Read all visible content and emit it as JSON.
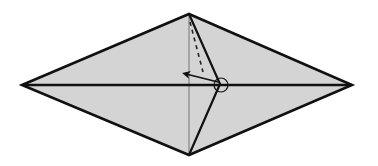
{
  "diagram": {
    "type": "origami-fold-step",
    "colors": {
      "paper_fill": "#d4d4d4",
      "line": "#111111",
      "crease": "#6a6a6a",
      "background": "#ffffff"
    },
    "shape": {
      "left_point": [
        22,
        85
      ],
      "right_point": [
        352,
        85
      ],
      "top_point": [
        189,
        14
      ],
      "bottom_point": [
        189,
        155
      ]
    },
    "elements": {
      "horizontal_center_line": "valley fold line",
      "vertical_crease": "existing crease",
      "flap_edge": "flap edge from top to center and down to bottom",
      "dashed_line": "fold line",
      "arrow": "fold direction arrow pointing left",
      "circle": "reference point marker"
    }
  }
}
